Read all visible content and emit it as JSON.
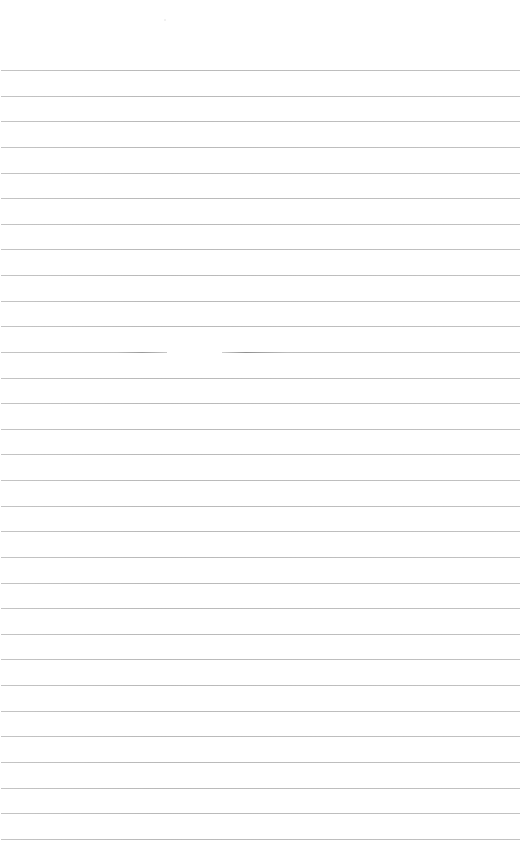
{
  "page": {
    "type": "blank-lined-sheet",
    "background_color": "#ffffff",
    "line_color": "#bdbdbd",
    "line_count": 31,
    "first_line_y": 70,
    "line_pitch": 25.63,
    "line_left": 1,
    "line_width": 519,
    "gapped_line_index": 11,
    "gap": {
      "start_x": 167,
      "end_x": 222
    },
    "text_content": ""
  }
}
